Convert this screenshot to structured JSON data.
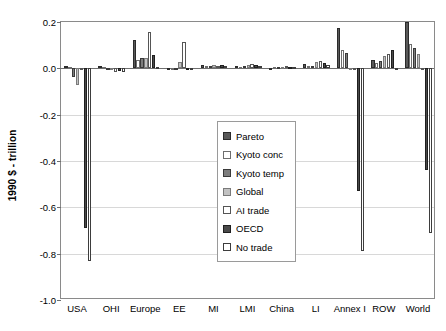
{
  "chart_data": {
    "type": "bar",
    "title": "",
    "subtitle": "",
    "xlabel": "",
    "ylabel": "1990 $ - trillion",
    "ylim": [
      -1.0,
      0.2
    ],
    "yticks": [
      "0.2",
      "0.0",
      "-0.2",
      "-0.4",
      "-0.6",
      "-0.8",
      "-1.0"
    ],
    "ytick_values": [
      0.2,
      0.0,
      -0.2,
      -0.4,
      -0.6,
      -0.8,
      -1.0
    ],
    "grid": true,
    "legend_position": "inside-center-left",
    "categories": [
      "USA",
      "OHI",
      "Europe",
      "EE",
      "MI",
      "LMI",
      "China",
      "LI",
      "Annex I",
      "ROW",
      "World"
    ],
    "series": [
      {
        "name": "Pareto",
        "color": "#595959",
        "values": [
          0.012,
          0.011,
          0.124,
          -0.008,
          0.014,
          0.009,
          -0.008,
          0.018,
          0.174,
          0.035,
          0.202
        ]
      },
      {
        "name": "Kyoto conc",
        "color": "#ffffff",
        "values": [
          0.006,
          0.004,
          0.036,
          0.003,
          0.011,
          0.007,
          0.004,
          0.009,
          0.08,
          0.021,
          0.104
        ]
      },
      {
        "name": "Kyoto temp",
        "color": "#7d7d7d",
        "values": [
          -0.036,
          -0.004,
          0.044,
          0.002,
          0.01,
          0.01,
          0.005,
          0.012,
          0.066,
          0.031,
          0.088
        ]
      },
      {
        "name": "Global",
        "color": "#c2c2c2",
        "values": [
          -0.074,
          -0.009,
          0.046,
          0.026,
          0.016,
          0.015,
          0.006,
          0.026,
          0.0,
          0.052,
          0.06
        ]
      },
      {
        "name": "AI trade",
        "color": "#ffffff",
        "values": [
          -0.006,
          -0.014,
          0.158,
          0.112,
          0.012,
          0.02,
          0.008,
          0.033,
          0.0,
          0.064,
          0.0
        ]
      },
      {
        "name": "OECD",
        "color": "#4a4a4a",
        "values": [
          -0.688,
          -0.012,
          0.056,
          0.003,
          0.014,
          0.014,
          0.006,
          0.022,
          -0.53,
          0.077,
          -0.44
        ]
      },
      {
        "name": "No trade",
        "color": "#ffffff",
        "values": [
          -0.832,
          -0.018,
          0.006,
          0.002,
          0.009,
          0.011,
          0.005,
          0.015,
          -0.79,
          0.0,
          -0.71
        ]
      }
    ]
  },
  "legend": {
    "items": [
      {
        "label": "Pareto",
        "swatch": "legend-swatch-pareto"
      },
      {
        "label": "Kyoto conc",
        "swatch": "legend-swatch-kyoto-conc"
      },
      {
        "label": "Kyoto temp",
        "swatch": "legend-swatch-kyoto-temp"
      },
      {
        "label": "Global",
        "swatch": "legend-swatch-global"
      },
      {
        "label": "AI trade",
        "swatch": "legend-swatch-ai-trade"
      },
      {
        "label": "OECD",
        "swatch": "legend-swatch-oecd"
      },
      {
        "label": "No trade",
        "swatch": "legend-swatch-no-trade"
      }
    ]
  }
}
